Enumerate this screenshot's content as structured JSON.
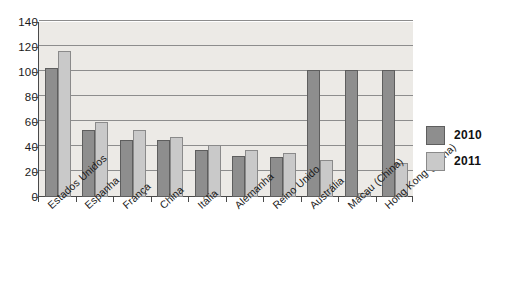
{
  "chart_data": {
    "type": "bar",
    "title": "",
    "subtitle": "",
    "xlabel": "",
    "ylabel": "",
    "ylim": [
      0,
      140
    ],
    "ytick_step": 20,
    "yticks": [
      0,
      20,
      40,
      60,
      80,
      100,
      120,
      140
    ],
    "grid": true,
    "legend_position": "right",
    "orientation": "vertical",
    "grouping": "clustered",
    "categories": [
      "Estados Unidos",
      "Espanha",
      "França",
      "China",
      "Itália",
      "Alemanha",
      "Reino Unido",
      "Austrália",
      "Macau (China)",
      "Hong Kong (China)"
    ],
    "series": [
      {
        "name": "2010",
        "color": "#8e8e8e",
        "values": [
          103,
          54,
          46,
          46,
          38,
          33,
          32,
          102,
          102,
          102
        ]
      },
      {
        "name": "2011",
        "color": "#c9c9c9",
        "values": [
          117,
          60,
          54,
          48,
          42,
          38,
          35,
          30,
          3,
          27
        ]
      }
    ]
  },
  "legend": {
    "entries": [
      {
        "label": "2010",
        "swatch": "dark-gray-swatch"
      },
      {
        "label": "2011",
        "swatch": "light-gray-swatch"
      }
    ]
  },
  "axes": {
    "y_tick_labels": [
      "140",
      "120",
      "100",
      "80",
      "60",
      "40",
      "20",
      "0"
    ]
  },
  "colors": {
    "series_2010": "#8e8e8e",
    "series_2011": "#c9c9c9",
    "plot_background": "#eceae6",
    "gridline": "#8d8d8d",
    "axis": "#4a4a4a",
    "text": "#1a1a1a",
    "page_background": "#ffffff"
  }
}
